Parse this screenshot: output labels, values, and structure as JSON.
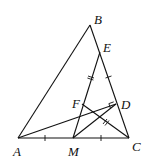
{
  "diagram": {
    "type": "geometry",
    "points": {
      "A": {
        "label": "A",
        "x": 18,
        "y": 138
      },
      "B": {
        "label": "B",
        "x": 90,
        "y": 25
      },
      "C": {
        "label": "C",
        "x": 129,
        "y": 138
      },
      "M": {
        "label": "M",
        "x": 73,
        "y": 138
      },
      "E": {
        "label": "E",
        "x": 100,
        "y": 52
      },
      "D": {
        "label": "D",
        "x": 116,
        "y": 104
      },
      "F": {
        "label": "F",
        "x": 82,
        "y": 104
      }
    },
    "segments": [
      "AB",
      "BC",
      "AC",
      "ME",
      "FC",
      "AD",
      "MD"
    ],
    "marks": {
      "single_tick": [
        "AM",
        "MC",
        "EC"
      ],
      "double_tick": [
        "ME",
        "FC"
      ],
      "right_angle": "D"
    }
  }
}
